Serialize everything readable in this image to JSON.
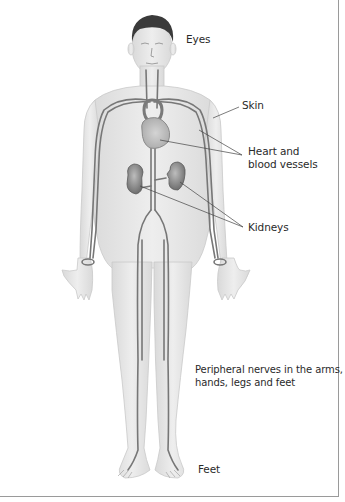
{
  "diagram": {
    "type": "anatomical-illustration",
    "labels": [
      {
        "id": "eyes",
        "text": "Eyes"
      },
      {
        "id": "skin",
        "text": "Skin"
      },
      {
        "id": "heart",
        "text_line1": "Heart and",
        "text_line2": "blood vessels"
      },
      {
        "id": "kidneys",
        "text": "Kidneys"
      },
      {
        "id": "nerves",
        "text_line1": "Peripheral nerves in the arms,",
        "text_line2": "hands, legs and feet"
      },
      {
        "id": "feet",
        "text": "Feet"
      }
    ],
    "colors": {
      "skin": "#e6e6e6",
      "skin_edge": "#c8c8c8",
      "vessel": "#777777",
      "organ": "#9a9a9a",
      "hair": "#3a3a3a",
      "leader_line": "#444444",
      "frame": "#9a9a9a"
    }
  }
}
